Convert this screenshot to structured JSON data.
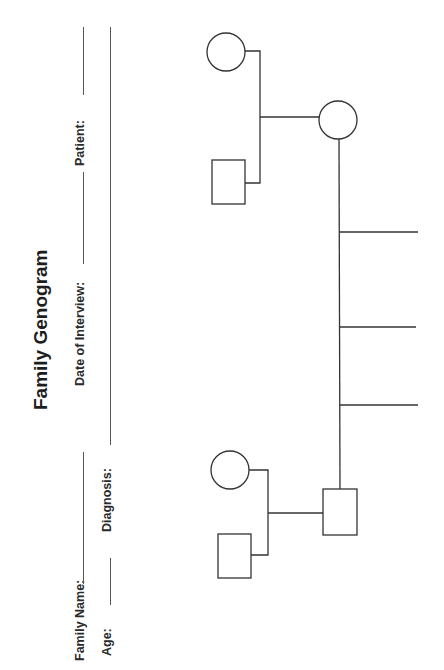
{
  "form": {
    "title": "Family Genogram",
    "fields": {
      "family_name": {
        "label": "Family Name:",
        "value": ""
      },
      "date_of_interview": {
        "label": "Date of Interview:",
        "value": ""
      },
      "patient": {
        "label": "Patient:",
        "value": ""
      },
      "age": {
        "label": "Age:",
        "value": ""
      },
      "diagnosis": {
        "label": "Diagnosis:",
        "value": ""
      }
    }
  },
  "genogram": {
    "orientation": "rotated-90-ccw",
    "stroke_color": "#333333",
    "nodes": [
      {
        "id": "gm-top",
        "shape": "circle",
        "role": "grandmother"
      },
      {
        "id": "gf-top",
        "shape": "square",
        "role": "grandfather"
      },
      {
        "id": "mother",
        "shape": "circle",
        "role": "parent"
      },
      {
        "id": "gm-bottom",
        "shape": "circle",
        "role": "grandmother"
      },
      {
        "id": "gf-bottom",
        "shape": "square",
        "role": "grandfather"
      },
      {
        "id": "father",
        "shape": "square",
        "role": "parent"
      }
    ],
    "children_slots": 3
  }
}
